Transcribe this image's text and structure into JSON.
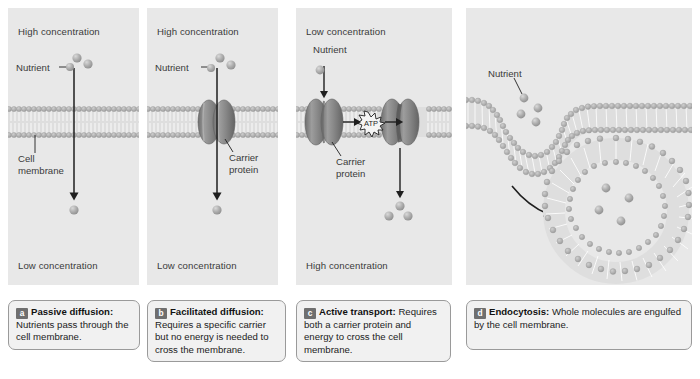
{
  "figure": {
    "background": "#ffffff",
    "panel_background": "#e8e8e8",
    "membrane_head_color": "#b5b5b5",
    "membrane_tail_color": "#dedede",
    "protein_color": "#8f8f8f",
    "nutrient_color": "#a9a9a9",
    "text_color": "#3a3a3a",
    "badge_color": "#6f6f6f"
  },
  "panels": [
    {
      "id": "a",
      "name": "passive-diffusion",
      "top_label": "High concentration",
      "bottom_label": "Low concentration",
      "labels": [
        {
          "name": "nutrient",
          "text": "Nutrient"
        },
        {
          "name": "cell-membrane",
          "line1": "Cell",
          "line2": "membrane"
        }
      ],
      "nutrient_count_above": 3,
      "nutrient_count_below": 1,
      "has_carrier_protein": false,
      "has_atp": false,
      "arrow_direction": "down"
    },
    {
      "id": "b",
      "name": "facilitated-diffusion",
      "top_label": "High concentration",
      "bottom_label": "Low concentration",
      "labels": [
        {
          "name": "nutrient",
          "text": "Nutrient"
        },
        {
          "name": "carrier-protein",
          "line1": "Carrier",
          "line2": "protein"
        }
      ],
      "nutrient_count_above": 3,
      "nutrient_count_below": 1,
      "has_carrier_protein": true,
      "has_atp": false,
      "arrow_direction": "down"
    },
    {
      "id": "c",
      "name": "active-transport",
      "top_label": "Low concentration",
      "bottom_label": "High concentration",
      "labels": [
        {
          "name": "nutrient",
          "text": "Nutrient"
        },
        {
          "name": "carrier-protein",
          "line1": "Carrier",
          "line2": "protein"
        },
        {
          "name": "atp",
          "text": "ATP"
        }
      ],
      "nutrient_count_above": 1,
      "nutrient_count_below": 3,
      "has_carrier_protein": true,
      "has_atp": true,
      "arrow_direction": "down"
    },
    {
      "id": "d",
      "name": "endocytosis",
      "top_label": "",
      "bottom_label": "",
      "labels": [
        {
          "name": "nutrient",
          "text": "Nutrient"
        }
      ],
      "nutrient_count_pocket": 4,
      "nutrient_count_vesicle": 4,
      "has_carrier_protein": false,
      "has_atp": false,
      "arrow_direction": "curved-down-right"
    }
  ],
  "captions": [
    {
      "badge": "a",
      "title": "Passive diffusion:",
      "body": " Nutrients pass through the cell membrane."
    },
    {
      "badge": "b",
      "title": "Facilitated diffusion:",
      "body": " Requires a specific carrier but no energy is needed to cross the membrane."
    },
    {
      "badge": "c",
      "title": "Active transport:",
      "body": " Requires both a carrier protein and energy to cross the cell membrane."
    },
    {
      "badge": "d",
      "title": "Endocytosis:",
      "body": " Whole molecules are engulfed by the cell membrane."
    }
  ]
}
